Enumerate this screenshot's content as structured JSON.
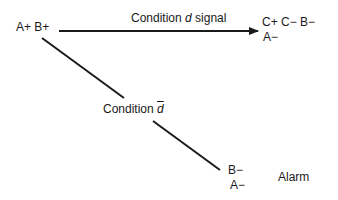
{
  "diagram": {
    "start_state": "A+  B+",
    "edge_top": {
      "label_prefix": "Condition ",
      "label_var": "d",
      "label_suffix": " signal"
    },
    "target_top": {
      "line1": "C+  C−  B−",
      "line2": "A−"
    },
    "edge_diag": {
      "label_prefix": "Condition ",
      "label_var": "d"
    },
    "target_bottom": {
      "line1": "B−",
      "line2": "A−"
    },
    "alarm_label": "Alarm",
    "colors": {
      "line": "#1a1a1a",
      "background": "#ffffff"
    }
  }
}
